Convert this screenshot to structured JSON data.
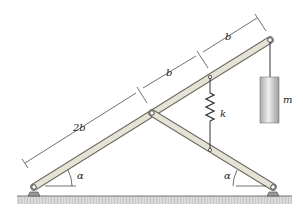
{
  "diagram": {
    "labels": {
      "dim_2b": "2b",
      "dim_b1": "b",
      "dim_b2": "b",
      "spring": "k",
      "mass": "m",
      "angle_left": "α",
      "angle_right": "α"
    },
    "colors": {
      "bar_fill": "#e6e3d6",
      "bar_stroke": "#6b6a62",
      "mass_fill": "#cfcfcf",
      "ground": "#bdbdbd",
      "line": "#333333"
    }
  }
}
